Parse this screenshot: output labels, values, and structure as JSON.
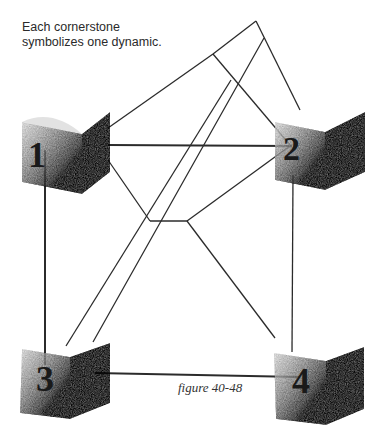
{
  "caption": {
    "line1": "Each cornerstone",
    "line2": "symbolizes one dynamic."
  },
  "figure_label": "figure 40-48",
  "cornerstones": [
    {
      "label": "1",
      "x": 22,
      "y": 112
    },
    {
      "label": "2",
      "x": 275,
      "y": 112
    },
    {
      "label": "3",
      "x": 18,
      "y": 343
    },
    {
      "label": "4",
      "x": 272,
      "y": 347
    }
  ],
  "colors": {
    "line": "#2b2b2b",
    "box_light": "#d8d8d8",
    "box_dark": "#2a2a2a"
  }
}
